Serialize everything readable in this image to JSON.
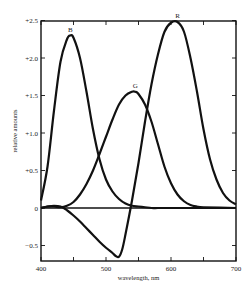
{
  "chart_data": {
    "type": "line",
    "title": "",
    "xlabel": "wavelength, nm",
    "ylabel": "relative amounts",
    "xlim": [
      400,
      700
    ],
    "ylim": [
      -0.72,
      2.5
    ],
    "grid": false,
    "legend": "inline labels at curve peaks",
    "x_ticks": [
      400,
      450,
      500,
      550,
      600,
      650,
      700
    ],
    "x_tick_labels": [
      "400",
      "500",
      "600",
      "700"
    ],
    "y_ticks": [
      2.5,
      2.0,
      1.5,
      1.0,
      0.5,
      0,
      -0.5
    ],
    "y_tick_labels": [
      "+2.5",
      "+2.0",
      "+1.5",
      "+1.0",
      "+0.5",
      "0",
      "−0.5"
    ],
    "zero_line": true,
    "series": [
      {
        "name": "B",
        "x": [
          400,
          410,
          420,
          430,
          440,
          445,
          450,
          460,
          470,
          480,
          490,
          500,
          510,
          520,
          530,
          540,
          550,
          560,
          570,
          580,
          600,
          650,
          700
        ],
        "values": [
          0.1,
          0.55,
          1.3,
          1.95,
          2.25,
          2.3,
          2.27,
          2.0,
          1.55,
          1.05,
          0.65,
          0.38,
          0.22,
          0.12,
          0.06,
          0.03,
          0.02,
          0.01,
          0.0,
          0.0,
          0.0,
          0.0,
          0.0
        ],
        "peak": {
          "x": 445,
          "y": 2.3
        }
      },
      {
        "name": "G",
        "x": [
          400,
          410,
          420,
          430,
          440,
          450,
          460,
          470,
          480,
          490,
          500,
          510,
          520,
          530,
          540,
          545,
          550,
          560,
          570,
          580,
          590,
          600,
          610,
          620,
          630,
          640,
          650,
          700
        ],
        "values": [
          0.0,
          0.02,
          0.02,
          0.01,
          0.03,
          0.08,
          0.18,
          0.32,
          0.5,
          0.72,
          0.95,
          1.18,
          1.38,
          1.5,
          1.55,
          1.55,
          1.52,
          1.38,
          1.15,
          0.85,
          0.55,
          0.33,
          0.18,
          0.09,
          0.04,
          0.02,
          0.01,
          0.0
        ],
        "peak": {
          "x": 545,
          "y": 1.55
        }
      },
      {
        "name": "R",
        "x": [
          400,
          410,
          420,
          430,
          440,
          450,
          460,
          470,
          480,
          490,
          500,
          510,
          515,
          520,
          525,
          530,
          540,
          550,
          560,
          570,
          580,
          590,
          600,
          610,
          620,
          630,
          640,
          650,
          660,
          670,
          680,
          690,
          700
        ],
        "values": [
          0.0,
          0.02,
          0.03,
          0.02,
          -0.03,
          -0.1,
          -0.18,
          -0.27,
          -0.36,
          -0.45,
          -0.53,
          -0.6,
          -0.64,
          -0.65,
          -0.55,
          -0.35,
          0.1,
          0.6,
          1.15,
          1.65,
          2.05,
          2.35,
          2.47,
          2.48,
          2.35,
          2.0,
          1.55,
          1.05,
          0.65,
          0.38,
          0.2,
          0.1,
          0.05
        ],
        "peak": {
          "x": 610,
          "y": 2.48
        },
        "minimum": {
          "x": 520,
          "y": -0.65
        }
      }
    ]
  },
  "axes": {
    "xlabel": "wavelength, nm",
    "ylabel": "relative amounts"
  },
  "labels": {
    "B": "B",
    "G": "G",
    "R": "R"
  }
}
